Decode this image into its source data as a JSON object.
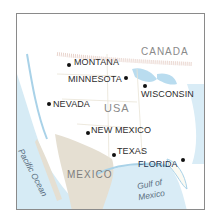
{
  "map": {
    "countries": {
      "canada": "CANADA",
      "usa": "USA",
      "mexico": "MEXICO"
    },
    "water_bodies": {
      "pacific": "Pacific Ocean",
      "gulf_line1": "Gulf of",
      "gulf_line2": "Mexico"
    },
    "states": [
      {
        "name": "MONTANA"
      },
      {
        "name": "MINNESOTA"
      },
      {
        "name": "WISCONSIN"
      },
      {
        "name": "NEVADA"
      },
      {
        "name": "NEW MEXICO"
      },
      {
        "name": "TEXAS"
      },
      {
        "name": "FLORIDA"
      }
    ],
    "colors": {
      "land_usa": "#fbfaf3",
      "land_mexico": "#e3ddd0",
      "water": "#cfe6f2",
      "border": "#e7c9c0",
      "label": "#2c2c2c",
      "country_label": "#8a8a8a"
    }
  }
}
